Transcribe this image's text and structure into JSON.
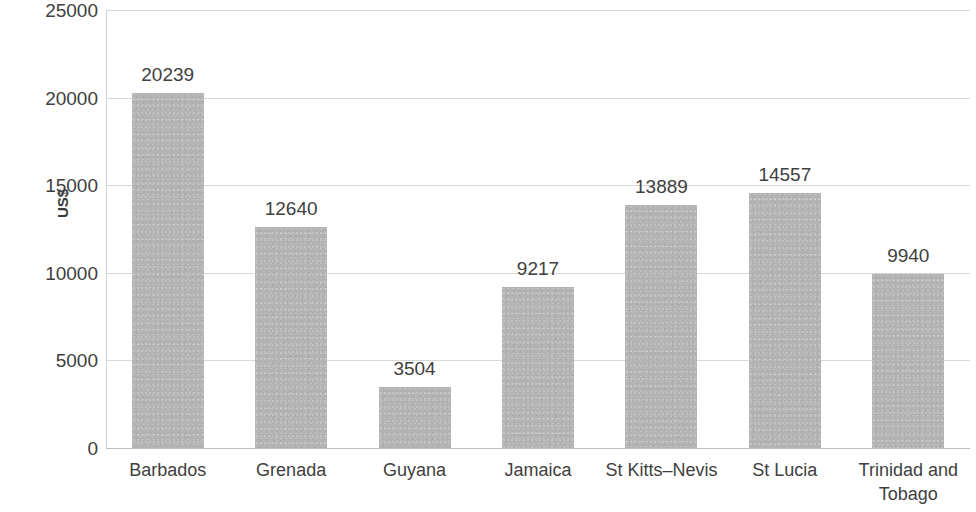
{
  "chart_data": {
    "type": "bar",
    "title": "",
    "subtitle": "",
    "xlabel": "",
    "ylabel": "US$",
    "categories": [
      "Barbados",
      "Grenada",
      "Guyana",
      "Jamaica",
      "St Kitts–Nevis",
      "St  Lucia",
      "Trinidad and Tobago"
    ],
    "values": [
      20239,
      12640,
      3504,
      9217,
      13889,
      14557,
      9940
    ],
    "data_labels": [
      "20239",
      "12640",
      "3504",
      "9217",
      "13889",
      "14557",
      "9940"
    ],
    "ylim": [
      0,
      25000
    ],
    "ytick_values": [
      0,
      5000,
      10000,
      15000,
      20000,
      25000
    ],
    "ytick_labels": [
      "0",
      "5000",
      "10000",
      "15000",
      "20000",
      "25000"
    ],
    "grid": true,
    "grid_axis": "y",
    "legend": false,
    "legend_position": "none",
    "bar_color": "#b4b4b4",
    "gridline_color": "#d8d8d8",
    "text_color": "#404040"
  }
}
